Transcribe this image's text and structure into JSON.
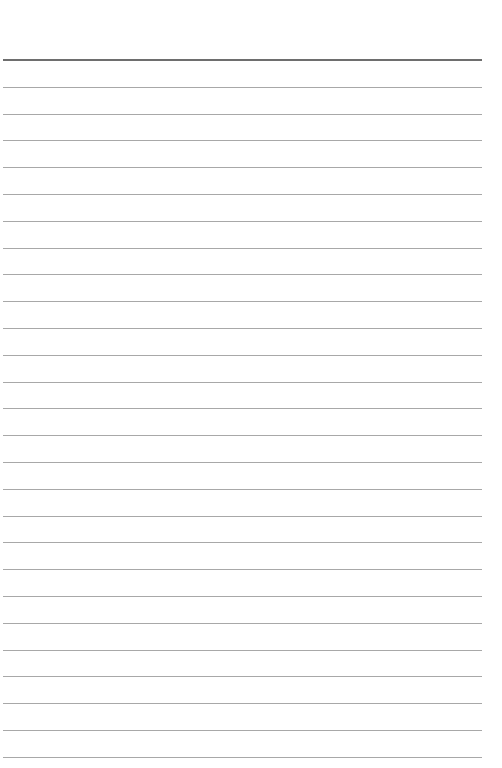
{
  "page": {
    "type": "lined-paper",
    "background_color": "#ffffff",
    "header_rule": {
      "y": 59,
      "color": "#6e6e6e",
      "thickness": 2
    },
    "line_rules": {
      "first_y": 86.8,
      "spacing": 26.8,
      "count": 26,
      "color": "#a8a8a8",
      "thickness": 1
    },
    "left": 3,
    "right": 482
  }
}
